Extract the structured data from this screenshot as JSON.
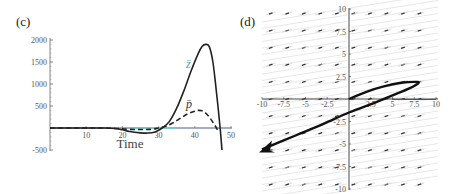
{
  "panels": {
    "left_label": "(c)",
    "right_label": "(d)"
  },
  "chart_data": [
    {
      "type": "line",
      "panel": "(c)",
      "title": "",
      "xlabel": "Time",
      "ylabel": "",
      "xlim": [
        0,
        50
      ],
      "ylim": [
        -500,
        2000
      ],
      "x_ticks": [
        "10",
        "20",
        "30",
        "40",
        "50"
      ],
      "y_ticks": [
        "2000",
        "1500",
        "1000",
        "500",
        "-500"
      ],
      "grid": false,
      "series": [
        {
          "name": "z̄",
          "style": "solid",
          "x": [
            0,
            10,
            15,
            18,
            20,
            22,
            25,
            27,
            29,
            31,
            33,
            35,
            37,
            39,
            41,
            42,
            43,
            44,
            45,
            46,
            47,
            47.5
          ],
          "values": [
            0,
            0,
            0,
            -10,
            -40,
            -80,
            -110,
            -115,
            -90,
            0,
            150,
            450,
            850,
            1300,
            1700,
            1850,
            1900,
            1850,
            1500,
            800,
            0,
            -500
          ]
        },
        {
          "name": "p̄",
          "style": "dashed",
          "x": [
            0,
            10,
            15,
            18,
            20,
            22,
            25,
            28,
            30,
            32,
            34,
            36,
            38,
            40,
            41,
            42,
            43,
            44,
            45,
            46,
            46.5
          ],
          "values": [
            0,
            0,
            0,
            -10,
            -20,
            -30,
            -35,
            -30,
            0,
            40,
            120,
            220,
            320,
            380,
            400,
            390,
            340,
            250,
            130,
            0,
            -100
          ]
        }
      ],
      "annotations": [
        {
          "text": "z̄",
          "x": 38,
          "y": 1500
        },
        {
          "text": "p̄",
          "x": 39,
          "y": 600
        }
      ]
    },
    {
      "type": "scatter",
      "subtype": "direction-field-with-trajectory",
      "panel": "(d)",
      "title": "",
      "xlabel": "",
      "ylabel": "",
      "xlim": [
        -10,
        10
      ],
      "ylim": [
        -10,
        10
      ],
      "x_ticks": [
        "-10",
        "-7.5",
        "-5",
        "-2.5",
        "2.5",
        "5",
        "7.5",
        "10"
      ],
      "y_ticks": [
        "10",
        "7.5",
        "5",
        "2.5",
        "-2.5",
        "-5",
        "-7.5",
        "-10"
      ],
      "grid": false,
      "field_direction": "arrows point left, slope approx 0.3",
      "trajectory": {
        "name": "trajectory",
        "x": [
          0,
          2,
          4,
          6,
          7.5,
          8,
          7,
          5,
          3,
          0,
          -3,
          -6,
          -8,
          -10
        ],
        "y": [
          0,
          0.8,
          1.4,
          1.8,
          1.9,
          1.8,
          1.2,
          0.4,
          -0.4,
          -1.5,
          -2.8,
          -4.0,
          -4.8,
          -5.6
        ],
        "end_marker": "arrowhead"
      }
    }
  ]
}
